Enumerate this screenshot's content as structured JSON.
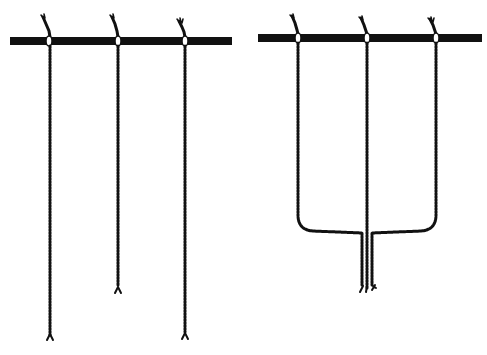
{
  "figure": {
    "colors": {
      "ink": "#111111",
      "background": "#ffffff"
    },
    "left_panel": {
      "rod": {
        "x1": 10,
        "x2": 232,
        "y": 41
      },
      "cords": [
        {
          "x": 50,
          "end_y": 340
        },
        {
          "x": 118,
          "end_y": 292
        },
        {
          "x": 185,
          "end_y": 338
        }
      ]
    },
    "right_panel": {
      "rod": {
        "x1": 258,
        "x2": 482,
        "y": 38
      },
      "cords": [
        {
          "x": 298
        },
        {
          "x": 367
        },
        {
          "x": 436
        }
      ],
      "join_y": 232,
      "bundle_end_y": 292
    }
  }
}
